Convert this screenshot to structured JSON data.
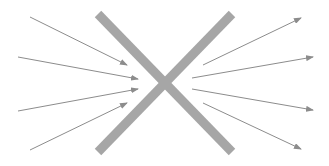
{
  "diagram": {
    "colors": {
      "background": "#ffffff",
      "cross": "#a6a6a6",
      "arrow": "#8c8c8c"
    },
    "cross": {
      "stroke_width": 9,
      "bars": [
        {
          "id": "bar-1",
          "x1": 98,
          "y1": 14,
          "x2": 232,
          "y2": 152
        },
        {
          "id": "bar-2",
          "x1": 98,
          "y1": 152,
          "x2": 232,
          "y2": 14
        }
      ]
    },
    "incoming_arrows": [
      {
        "id": "in-1",
        "x1": 30,
        "y1": 17,
        "x2": 127,
        "y2": 65
      },
      {
        "id": "in-2",
        "x1": 18,
        "y1": 57,
        "x2": 138,
        "y2": 79
      },
      {
        "id": "in-3",
        "x1": 18,
        "y1": 111,
        "x2": 138,
        "y2": 89
      },
      {
        "id": "in-4",
        "x1": 30,
        "y1": 150,
        "x2": 127,
        "y2": 103
      }
    ],
    "outgoing_arrows": [
      {
        "id": "out-1",
        "x1": 203,
        "y1": 65,
        "x2": 301,
        "y2": 18
      },
      {
        "id": "out-2",
        "x1": 192,
        "y1": 78,
        "x2": 313,
        "y2": 57
      },
      {
        "id": "out-3",
        "x1": 192,
        "y1": 89,
        "x2": 313,
        "y2": 110
      },
      {
        "id": "out-4",
        "x1": 203,
        "y1": 103,
        "x2": 301,
        "y2": 149
      }
    ]
  }
}
